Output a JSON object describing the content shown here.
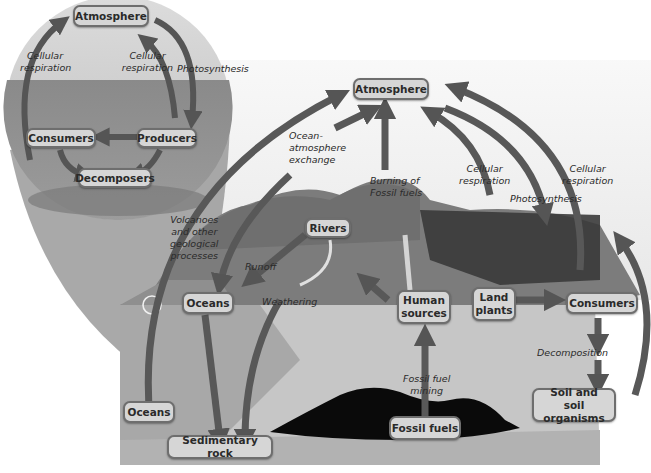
{
  "diagram": {
    "colors": {
      "box_fill": "#d6d6d6",
      "box_border": "#6e6e6e",
      "arrow": "#555555",
      "sky": "#e8e8e8",
      "ocean": "#8c8c8c",
      "land": "#7d7d7d",
      "subsurface": "#c4c4c4",
      "fossil_fuel_deposit": "#0a0a0a"
    },
    "inset": {
      "name": "aquatic carbon cycle",
      "nodes": {
        "atmosphere": "Atmosphere",
        "consumers": "Consumers",
        "producers": "Producers",
        "decomposers": "Decomposers"
      },
      "labels": {
        "cellular_respiration_left": "Cellular respiration",
        "cellular_respiration_right": "Cellular respiration",
        "photosynthesis": "Photosynthesis"
      }
    },
    "main": {
      "nodes": {
        "atmosphere": "Atmosphere",
        "rivers": "Rivers",
        "oceans_surface": "Oceans",
        "oceans_deep": "Oceans",
        "human_sources_line1": "Human",
        "human_sources_line2": "sources",
        "land_plants_line1": "Land",
        "land_plants_line2": "plants",
        "consumers": "Consumers",
        "soil_line1": "Soil and",
        "soil_line2": "soil organisms",
        "fossil_fuels": "Fossil fuels",
        "sedimentary_rock": "Sedimentary rock"
      },
      "labels": {
        "ocean_exchange_1": "Ocean-",
        "ocean_exchange_2": "atmosphere",
        "ocean_exchange_3": "exchange",
        "burning_1": "Burning of",
        "burning_2": "Fossil fuels",
        "cellular_resp_mid_1": "Cellular",
        "cellular_resp_mid_2": "respiration",
        "cellular_resp_right_1": "Cellular",
        "cellular_resp_right_2": "respiration",
        "photosynthesis": "Photosynthesis",
        "volcanoes_1": "Volcanoes",
        "volcanoes_2": "and other",
        "volcanoes_3": "geological",
        "volcanoes_4": "processes",
        "runoff": "Runoff",
        "weathering": "Weathering",
        "fossil_mining_1": "Fossil fuel",
        "fossil_mining_2": "mining",
        "decomposition": "Decomposition"
      }
    }
  }
}
